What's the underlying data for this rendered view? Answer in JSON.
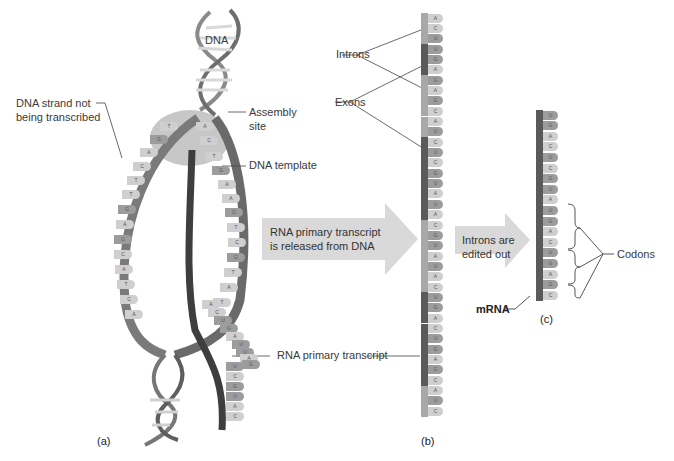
{
  "figure": {
    "panels": [
      {
        "id": "a",
        "label": "(a)"
      },
      {
        "id": "b",
        "label": "(b)"
      },
      {
        "id": "c",
        "label": "(c)"
      }
    ]
  },
  "panel_a": {
    "labels": {
      "dna": "DNA",
      "nontemplate_line1": "DNA strand not",
      "nontemplate_line2": "being transcribed",
      "assembly_line1": "Assembly",
      "assembly_line2": "site",
      "template": "DNA template",
      "primary_transcript": "RNA primary transcript"
    },
    "left_strand_bases": [
      "T",
      "G",
      "A",
      "C",
      "T",
      "T",
      "G",
      "A",
      "G",
      "C",
      "A",
      "T",
      "C",
      "A"
    ],
    "template_strand_bases": [
      "A",
      "C",
      "T",
      "G",
      "A",
      "A",
      "G",
      "T",
      "C",
      "G",
      "T",
      "A",
      "T"
    ],
    "rna_growing_bases": [
      "A",
      "C",
      "U",
      "G",
      "A",
      "U",
      "U",
      "A",
      "G"
    ],
    "rna_tail_bases": [
      "U",
      "C",
      "G",
      "U",
      "A",
      "C"
    ],
    "bottom_helix_bases": [
      [
        "T",
        "A"
      ],
      [
        "C",
        "G"
      ],
      [
        "A",
        "T"
      ]
    ]
  },
  "arrows": [
    {
      "line1": "RNA primary transcript",
      "line2": "is released from DNA"
    },
    {
      "line1": "Introns are",
      "line2": "edited out"
    }
  ],
  "panel_b": {
    "labels": {
      "introns": "Introns",
      "exons": "Exons"
    },
    "colors": {
      "intron_backbone": "#5a5a5a",
      "exon_backbone": "#a8a8a8",
      "base_light": "#cfcfcf",
      "base_dark": "#9c9c9c"
    },
    "sequence": [
      "A",
      "C",
      "U",
      "U",
      "G",
      "A",
      "G",
      "A",
      "G",
      "C",
      "A",
      "U",
      "C",
      "U",
      "C",
      "G",
      "U",
      "A",
      "U",
      "A",
      "C",
      "G",
      "U",
      "A",
      "U",
      "A",
      "C",
      "U",
      "G",
      "A",
      "C",
      "U",
      "G",
      "A",
      "G",
      "C",
      "A",
      "U",
      "C"
    ],
    "segments": [
      {
        "type": "exon",
        "start": 0,
        "end": 3
      },
      {
        "type": "intron",
        "start": 3,
        "end": 6
      },
      {
        "type": "exon",
        "start": 6,
        "end": 12
      },
      {
        "type": "intron",
        "start": 12,
        "end": 20
      },
      {
        "type": "exon",
        "start": 20,
        "end": 27
      },
      {
        "type": "intron",
        "start": 27,
        "end": 36
      },
      {
        "type": "exon",
        "start": 36,
        "end": 39
      }
    ]
  },
  "panel_c": {
    "labels": {
      "codons": "Codons",
      "mrna": "mRNA"
    },
    "sequence": [
      "U",
      "G",
      "A",
      "C",
      "U",
      "C",
      "G",
      "U",
      "A",
      "U",
      "G",
      "A",
      "C",
      "U",
      "G",
      "A",
      "G",
      "C"
    ],
    "codon_groups": [
      [
        9,
        11
      ],
      [
        12,
        14
      ],
      [
        15,
        17
      ]
    ]
  }
}
